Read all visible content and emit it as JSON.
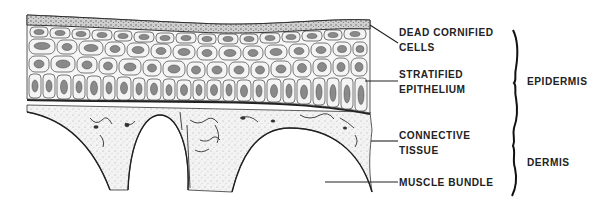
{
  "diagram": {
    "labels": [
      {
        "id": "dead-cornified-cells",
        "lines": [
          "DEAD CORNIFIED",
          "CELLS"
        ]
      },
      {
        "id": "stratified-epithelium",
        "lines": [
          "STRATIFIED",
          "EPITHELIUM"
        ]
      },
      {
        "id": "connective-tissue",
        "lines": [
          "CONNECTIVE",
          "TISSUE"
        ]
      },
      {
        "id": "muscle-bundle",
        "lines": [
          "MUSCLE BUNDLE"
        ]
      }
    ],
    "groups": [
      {
        "id": "epidermis",
        "label": "EPIDERMIS"
      },
      {
        "id": "dermis",
        "label": "DERMIS"
      }
    ],
    "colors": {
      "ink": "#222222",
      "background": "#ffffff",
      "dermis_fill": "#efefef",
      "cell_fill": "#f4f4f4"
    }
  }
}
